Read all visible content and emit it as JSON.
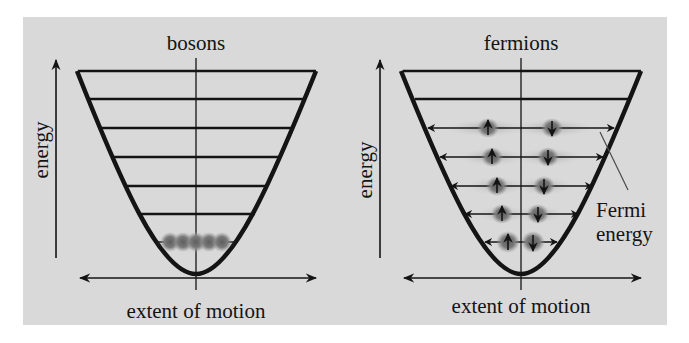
{
  "colors": {
    "panel_bg": "#d9d9d9",
    "page_bg": "#ffffff",
    "ink": "#141414",
    "particle": "#6e6e6e",
    "particle_glow": "#a9a9a9"
  },
  "panels": [
    {
      "id": "bosons",
      "title": "bosons",
      "y_axis_label": "energy",
      "x_axis_label": "extent of motion",
      "energy_levels": 7,
      "occupied_levels": [
        1
      ],
      "particles_in_ground_state": 5,
      "description": "All bosons condense into the lowest energy level"
    },
    {
      "id": "fermions",
      "title": "fermions",
      "y_axis_label": "energy",
      "x_axis_label": "extent of motion",
      "energy_levels": 7,
      "occupied_levels": [
        1,
        2,
        3,
        4,
        5
      ],
      "particles_per_level": 2,
      "spins": [
        "up",
        "down"
      ],
      "annotation": {
        "line1": "Fermi",
        "line2": "energy"
      },
      "description": "Fermions fill levels pairwise (spin up and spin down) up to the Fermi energy"
    }
  ]
}
